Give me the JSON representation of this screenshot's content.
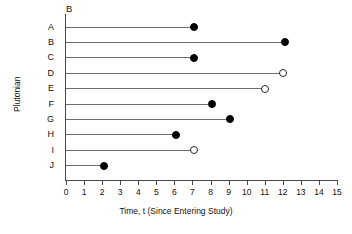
{
  "chart_data": {
    "type": "scatter",
    "title": "",
    "panel_label": "B",
    "xlabel": "Time, t (Since Entering Study)",
    "ylabel": "Plutonian",
    "xlim": [
      0,
      15
    ],
    "xticks": [
      0,
      1,
      2,
      3,
      4,
      5,
      6,
      7,
      8,
      9,
      10,
      11,
      12,
      13,
      14,
      15
    ],
    "xticklabels": [
      "0",
      "1",
      "2",
      "3",
      "4",
      "5",
      "6",
      "7",
      "8",
      "9",
      "10",
      "11",
      "12",
      "13",
      "14",
      "15"
    ],
    "grid": false,
    "legend": null,
    "categories": [
      "A",
      "B",
      "C",
      "D",
      "E",
      "F",
      "G",
      "H",
      "I",
      "J"
    ],
    "values": [
      7.1,
      12.1,
      7.1,
      12.0,
      11.0,
      8.1,
      9.1,
      6.1,
      7.1,
      2.1
    ],
    "marker_styles": [
      "filled",
      "filled",
      "filled",
      "open",
      "open",
      "filled",
      "filled",
      "filled",
      "open",
      "filled"
    ],
    "points": [
      {
        "category": "A",
        "value": 7.1,
        "marker": "filled"
      },
      {
        "category": "B",
        "value": 12.1,
        "marker": "filled"
      },
      {
        "category": "C",
        "value": 7.1,
        "marker": "filled"
      },
      {
        "category": "D",
        "value": 12.0,
        "marker": "open"
      },
      {
        "category": "E",
        "value": 11.0,
        "marker": "open"
      },
      {
        "category": "F",
        "value": 8.1,
        "marker": "filled"
      },
      {
        "category": "G",
        "value": 9.1,
        "marker": "filled"
      },
      {
        "category": "H",
        "value": 6.1,
        "marker": "filled"
      },
      {
        "category": "I",
        "value": 7.1,
        "marker": "open"
      },
      {
        "category": "J",
        "value": 2.1,
        "marker": "filled"
      }
    ],
    "colors": {
      "filled_marker": "#000000",
      "open_marker": "#ffffff",
      "marker_edge": "#2a2a2a",
      "stem": "#6e6e6e",
      "axis": "#4a4a4a",
      "background": "#ffffff",
      "text": "#111111"
    }
  }
}
